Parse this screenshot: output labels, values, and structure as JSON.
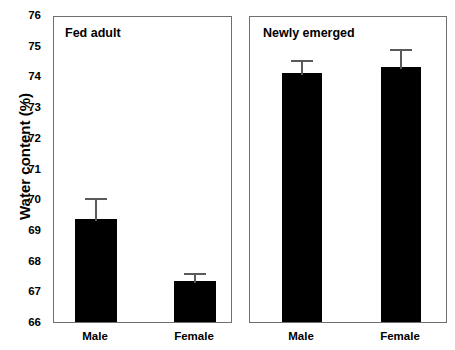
{
  "chart_data": {
    "type": "bar",
    "title": "",
    "subtitle": "",
    "xlabel": "",
    "ylabel": "Water content (%)",
    "ylim": [
      66,
      76
    ],
    "ytick_values": [
      66,
      67,
      68,
      69,
      70,
      71,
      72,
      73,
      74,
      75,
      76
    ],
    "ytick_labels": [
      "66",
      "67",
      "68",
      "69",
      "70",
      "71",
      "72",
      "73",
      "74",
      "75",
      "76"
    ],
    "grid": false,
    "legend": null,
    "bar_color": "#000000",
    "error_color": "#5a5a5a",
    "panel_border_color": "#6f6f6f",
    "panels": [
      {
        "name": "Fed adult",
        "categories": [
          "Male",
          "Female"
        ],
        "values": [
          69.35,
          67.35
        ],
        "errors": [
          0.75,
          0.3
        ],
        "error_upper": [
          70.1,
          67.65
        ]
      },
      {
        "name": "Newly emerged",
        "categories": [
          "Male",
          "Female"
        ],
        "values": [
          74.1,
          74.3
        ],
        "errors": [
          0.5,
          0.65
        ],
        "error_upper": [
          74.6,
          74.95
        ]
      }
    ]
  },
  "axis": {
    "ylabel": "Water content (%)"
  },
  "panel_left": {
    "title": "Fed adult",
    "cat_male": "Male",
    "cat_female": "Female"
  },
  "panel_right": {
    "title": "Newly emerged",
    "cat_male": "Male",
    "cat_female": "Female"
  }
}
